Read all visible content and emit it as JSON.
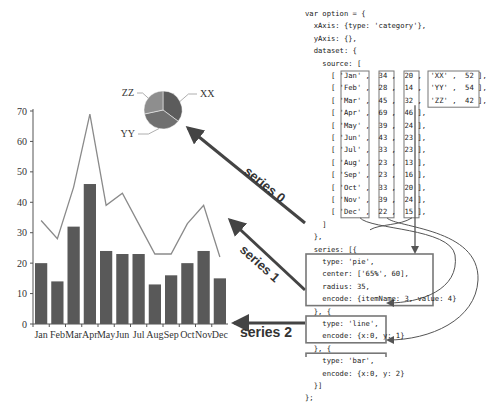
{
  "chart_data": [
    {
      "type": "bar",
      "title": "",
      "xlabel": "",
      "ylabel": "",
      "categories": [
        "Jan",
        "Feb",
        "Mar",
        "Apr",
        "May",
        "Jun",
        "Jul",
        "Aug",
        "Sep",
        "Oct",
        "Nov",
        "Dec"
      ],
      "series": [
        {
          "name": "series 1 (line)",
          "type": "line",
          "values": [
            34,
            28,
            45,
            69,
            39,
            43,
            33,
            23,
            23,
            33,
            39,
            22
          ]
        },
        {
          "name": "series 2 (bar)",
          "type": "bar",
          "values": [
            20,
            14,
            32,
            46,
            24,
            23,
            23,
            13,
            16,
            20,
            24,
            15
          ]
        }
      ],
      "yticks": [
        0,
        10,
        20,
        30,
        40,
        50,
        60,
        70
      ],
      "ylim": [
        0,
        70
      ],
      "grid": false,
      "legend": "none"
    },
    {
      "type": "pie",
      "title": "",
      "labels": [
        "XX",
        "YY",
        "ZZ"
      ],
      "values": [
        52,
        54,
        42
      ]
    }
  ],
  "chart": {
    "yticks": [
      "0",
      "10",
      "20",
      "30",
      "40",
      "50",
      "60",
      "70"
    ],
    "categories": [
      "Jan",
      "Feb",
      "Mar",
      "Apr",
      "May",
      "Jun",
      "Jul",
      "Aug",
      "Sep",
      "Oct",
      "Nov",
      "Dec"
    ],
    "pie_labels": [
      "XX",
      "YY",
      "ZZ"
    ]
  },
  "annotations": {
    "series0": "series 0",
    "series1": "series 1",
    "series2": "series 2"
  },
  "code": {
    "lines": [
      "var option = {",
      "  xAxis: {type: 'category'},",
      "  yAxis: {},",
      "  dataset: {",
      "    source: [",
      "      [ 'Jan' ,  34 ,  20 ,  'XX' ,  52 ],",
      "      [ 'Feb' ,  28 ,  14 ,  'YY' ,  54 ],",
      "      [ 'Mar' ,  45 ,  32 ,  'ZZ' ,  42 ],",
      "      [ 'Apr' ,  69 ,  46 ],",
      "      [ 'May' ,  39 ,  24 ],",
      "      [ 'Jun' ,  43 ,  23 ],",
      "      [ 'Jul' ,  33 ,  23 ],",
      "      [ 'Aug' ,  23 ,  13 ],",
      "      [ 'Sep' ,  23 ,  16 ],",
      "      [ 'Oct' ,  33 ,  20 ],",
      "      [ 'Nov' ,  39 ,  24 ],",
      "      [ 'Dec' ,  22 ,  15 ],",
      "    ]",
      "  },",
      "  series: [{",
      "    type: 'pie',",
      "    center: ['65%', 60],",
      "    radius: 35,",
      "    encode: {itemName: 3, value: 4}",
      "  }, {",
      "    type: 'line',",
      "    encode: {x:0, y: 1}",
      "  }, {",
      "    type: 'bar',",
      "    encode: {x:0, y: 2}",
      "  }]",
      "};"
    ]
  }
}
